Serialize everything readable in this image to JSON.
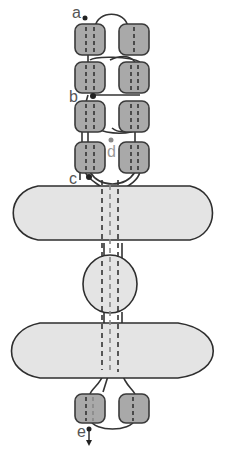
{
  "diagram": {
    "labels": {
      "a": "a",
      "b": "b",
      "c": "c",
      "d": "d",
      "e": "e"
    },
    "colors": {
      "block_fill": "#a9a9a9",
      "block_stroke": "#3a3a3a",
      "ellipse_fill": "#e4e4e4",
      "ellipse_stroke": "#2e2e2e",
      "line": "#333333",
      "background": "#ffffff"
    },
    "components": {
      "top_block_pairs": 4,
      "bottom_block_pairs": 1,
      "ellipses": [
        "upper-ellipse",
        "middle-circle",
        "lower-ellipse"
      ],
      "junction_points": [
        "a",
        "b",
        "c",
        "d",
        "e"
      ]
    }
  }
}
